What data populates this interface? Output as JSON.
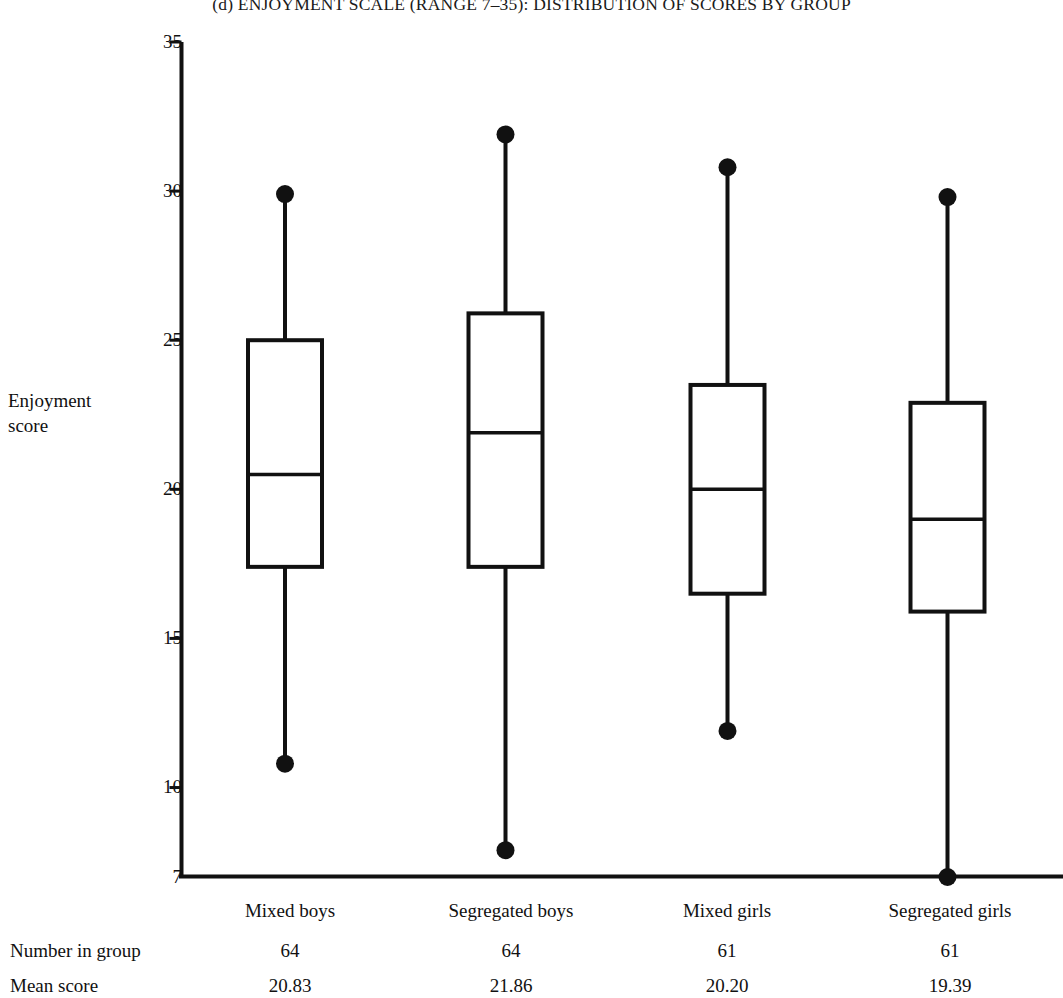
{
  "figure": {
    "title": "(d) ENJOYMENT SCALE (RANGE 7–35): DISTRIBUTION OF SCORES BY GROUP",
    "y_axis_label_line1": "Enjoyment",
    "y_axis_label_line2": "score",
    "ink_color": "#111111",
    "background_color": "#ffffff"
  },
  "table": {
    "row_labels": {
      "number_in_group": "Number in group",
      "mean_score": "Mean score"
    },
    "group_names": [
      "Mixed boys",
      "Segregated boys",
      "Mixed girls",
      "Segregated girls"
    ],
    "number_in_group": [
      "64",
      "64",
      "61",
      "61"
    ],
    "mean_score": [
      "20.83",
      "21.86",
      "20.20",
      "19.39"
    ]
  },
  "chart_data": {
    "type": "box",
    "title": "(d) ENJOYMENT SCALE (RANGE 7–35): DISTRIBUTION OF SCORES BY GROUP",
    "xlabel": "",
    "ylabel": "Enjoyment score",
    "ylim": [
      7,
      35
    ],
    "yticks": [
      35,
      30,
      25,
      20,
      15,
      10,
      7
    ],
    "ytick_labels": [
      "35",
      "30",
      "25",
      "20",
      "15",
      "10",
      "7"
    ],
    "grid": false,
    "legend": "none",
    "categories": [
      "Mixed boys",
      "Segregated boys",
      "Mixed girls",
      "Segregated girls"
    ],
    "boxes": [
      {
        "name": "Mixed boys",
        "whisker_high": 29.9,
        "q3": 25.0,
        "median": 20.5,
        "q1": 17.4,
        "whisker_low": 10.8,
        "n": 64,
        "mean": 20.83,
        "high_marker": "dot",
        "low_marker": "dot"
      },
      {
        "name": "Segregated boys",
        "whisker_high": 31.9,
        "q3": 25.9,
        "median": 21.9,
        "q1": 17.4,
        "whisker_low": 7.9,
        "n": 64,
        "mean": 21.86,
        "high_marker": "dot",
        "low_marker": "dot"
      },
      {
        "name": "Mixed girls",
        "whisker_high": 30.8,
        "q3": 23.5,
        "median": 20.0,
        "q1": 16.5,
        "whisker_low": 11.9,
        "n": 61,
        "mean": 20.2,
        "high_marker": "dot",
        "low_marker": "dot"
      },
      {
        "name": "Segregated girls",
        "whisker_high": 29.8,
        "q3": 22.9,
        "median": 19.0,
        "q1": 15.9,
        "whisker_low": 7.0,
        "n": 61,
        "mean": 19.39,
        "high_marker": "dot",
        "low_marker": "dot"
      }
    ]
  }
}
